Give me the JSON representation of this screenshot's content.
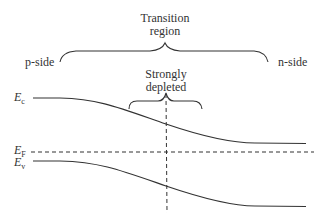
{
  "diagram": {
    "title_label": [
      "Transition",
      "region"
    ],
    "left_label": "p-side",
    "right_label": "n-side",
    "inner_label": [
      "Strongly",
      "depleted"
    ],
    "levels": [
      {
        "symbol": "E",
        "subscript": "c",
        "name": "conduction band edge"
      },
      {
        "symbol": "E",
        "subscript": "F",
        "name": "Fermi level"
      },
      {
        "symbol": "E",
        "subscript": "v",
        "name": "valence band edge"
      }
    ],
    "colors": {
      "line": "#333333",
      "background": "#ffffff"
    }
  }
}
